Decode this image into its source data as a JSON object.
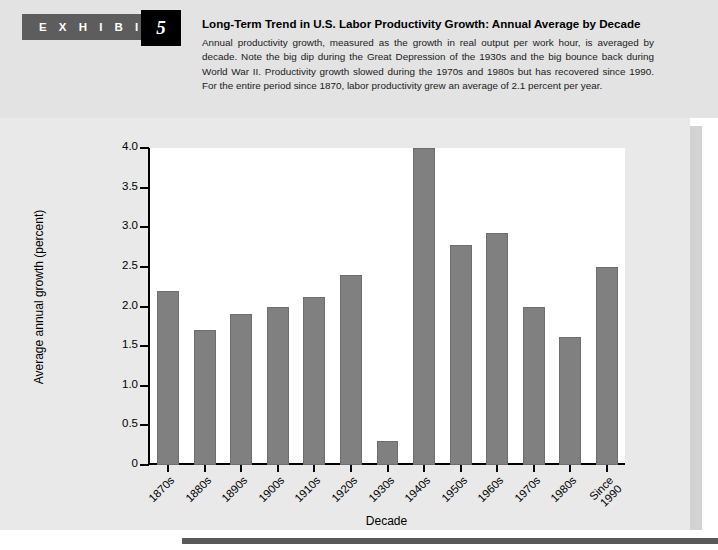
{
  "header": {
    "exhibit_label": "E X H I B I T",
    "exhibit_number": "5",
    "title": "Long-Term Trend in U.S. Labor Productivity Growth: Annual Average by Decade",
    "description": "Annual productivity growth, measured as the growth in real output per work hour, is averaged by decade. Note the big dip during the Great Depression of the 1930s and the big bounce back during World War II. Productivity growth slowed during the 1970s and 1980s but has recovered since 1990. For the entire period since 1870, labor productivity grew an average of 2.1 percent per year."
  },
  "colors": {
    "bar_fill": "#808080",
    "bar_stroke": "#6e6e6e",
    "panel_background": "#e9e9e9",
    "header_background": "#e3e3e3",
    "exhibit_tab": "#5d5d5d",
    "exhibit_number_box": "#000000",
    "plot_background": "#ffffff",
    "axis": "#000000"
  },
  "chart_data": {
    "type": "bar",
    "title": "Long-Term Trend in U.S. Labor Productivity Growth: Annual Average by Decade",
    "xlabel": "Decade",
    "ylabel": "Average annual growth (percent)",
    "categories": [
      "1870s",
      "1880s",
      "1890s",
      "1900s",
      "1910s",
      "1920s",
      "1930s",
      "1940s",
      "1950s",
      "1960s",
      "1970s",
      "1980s",
      "Since 1990"
    ],
    "values": [
      2.2,
      1.7,
      1.9,
      2.0,
      2.12,
      2.4,
      0.3,
      4.0,
      2.78,
      2.93,
      2.0,
      1.62,
      2.5
    ],
    "ylim": [
      0,
      4.0
    ],
    "ytick_labels": [
      "0",
      "0.5",
      "1.0",
      "1.5",
      "2.0",
      "2.5",
      "3.0",
      "3.5",
      "4.0"
    ],
    "ytick_values": [
      0,
      0.5,
      1.0,
      1.5,
      2.0,
      2.5,
      3.0,
      3.5,
      4.0
    ],
    "grid": false,
    "legend": "none"
  }
}
